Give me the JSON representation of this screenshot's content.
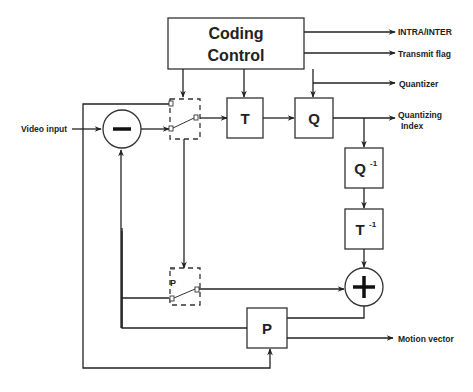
{
  "diagram": {
    "type": "video-codec-block-diagram",
    "blocks": {
      "coding_control": {
        "line1": "Coding",
        "line2": "Control"
      },
      "transform": {
        "label": "T"
      },
      "quantizer": {
        "label": "Q"
      },
      "inverse_quantizer": {
        "label": "Q",
        "sup": "-1"
      },
      "inverse_transform": {
        "label": "T",
        "sup": "-1"
      },
      "predictor": {
        "label": "P"
      }
    },
    "operators": {
      "subtractor": {
        "symbol": "minus"
      },
      "adder": {
        "symbol": "plus"
      }
    },
    "switches": {
      "upper": {
        "pin_label": "P"
      },
      "lower": {
        "pin_label": "P"
      }
    },
    "inputs": {
      "video_input": "Video input"
    },
    "outputs": {
      "intra_inter": "INTRA/INTER",
      "transmit_flag": "Transmit flag",
      "quantizer": "Quantizer",
      "quantizing_index_1": "Quantizing",
      "quantizing_index_2": "Index",
      "motion_vector": "Motion vector"
    }
  }
}
